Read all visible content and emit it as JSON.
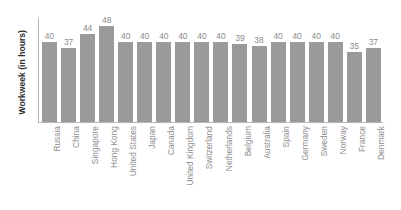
{
  "chart_data": {
    "type": "bar",
    "title": "",
    "xlabel": "",
    "ylabel": "Workweek (in hours)",
    "ylim": [
      0,
      52
    ],
    "grid": false,
    "legend": false,
    "bar_color": "#9a9a9a",
    "axis_color": "#b7b7b7",
    "label_color": "#8e8e8e",
    "value_label_color": "#8a8a8a",
    "ylabel_color": "#2e2e2e",
    "categories": [
      "Russia",
      "China",
      "Singapore",
      "Hong Kong",
      "United States",
      "Japan",
      "Canada",
      "United Kingdom",
      "Switzerland",
      "Netherlands",
      "Belgium",
      "Australia",
      "Spain",
      "Germany",
      "Sweden",
      "Norway",
      "France",
      "Denmark"
    ],
    "values": [
      40,
      37,
      44,
      48,
      40,
      40,
      40,
      40,
      40,
      40,
      39,
      38,
      40,
      40,
      40,
      40,
      35,
      37
    ]
  }
}
